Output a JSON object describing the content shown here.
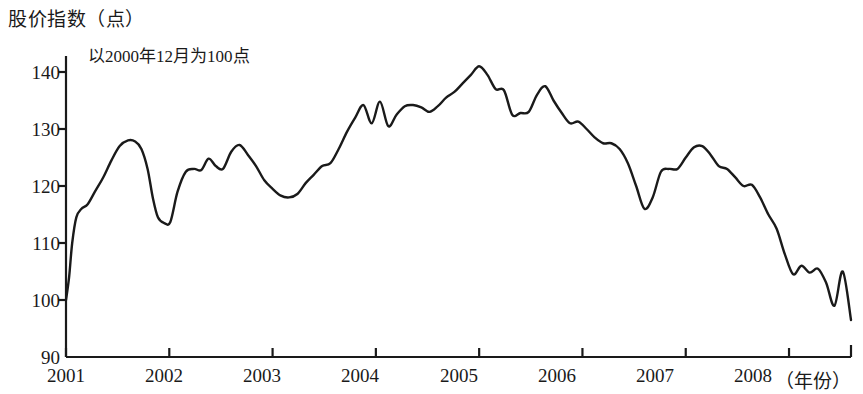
{
  "chart_data": {
    "type": "line",
    "title": "股价指数（点）",
    "annotation": "以2000年12月为100点",
    "xlabel": "（年份）",
    "ylabel": "股价指数（点）",
    "ylim": [
      90,
      140
    ],
    "xlim": [
      2001,
      2008.6
    ],
    "grid": false,
    "legend": null,
    "ytick_labels": [
      "140",
      "130",
      "120",
      "110",
      "100",
      "90"
    ],
    "ytick_values": [
      140,
      130,
      120,
      110,
      100,
      90
    ],
    "xtick_labels": [
      "2001",
      "2002",
      "2003",
      "2004",
      "2005",
      "2006",
      "2007",
      "2008"
    ],
    "xtick_values": [
      2001,
      2002,
      2003,
      2004,
      2005,
      2006,
      2007,
      2008
    ],
    "series": [
      {
        "name": "股价指数",
        "color": "#1a1a1a",
        "x": [
          2001.0,
          2001.03,
          2001.06,
          2001.1,
          2001.15,
          2001.21,
          2001.28,
          2001.36,
          2001.44,
          2001.52,
          2001.6,
          2001.67,
          2001.73,
          2001.79,
          2001.84,
          2001.89,
          2001.95,
          2002.01,
          2002.08,
          2002.16,
          2002.24,
          2002.31,
          2002.38,
          2002.45,
          2002.52,
          2002.6,
          2002.68,
          2002.76,
          2002.84,
          2002.92,
          2003.0,
          2003.08,
          2003.16,
          2003.24,
          2003.32,
          2003.4,
          2003.48,
          2003.56,
          2003.64,
          2003.72,
          2003.8,
          2003.88,
          2003.96,
          2004.04,
          2004.12,
          2004.2,
          2004.28,
          2004.36,
          2004.44,
          2004.52,
          2004.6,
          2004.68,
          2004.76,
          2004.84,
          2004.92,
          2005.0,
          2005.08,
          2005.16,
          2005.24,
          2005.32,
          2005.4,
          2005.48,
          2005.56,
          2005.64,
          2005.72,
          2005.8,
          2005.88,
          2005.96,
          2006.04,
          2006.12,
          2006.2,
          2006.28,
          2006.36,
          2006.44,
          2006.52,
          2006.6,
          2006.68,
          2006.76,
          2006.84,
          2006.92,
          2007.0,
          2007.08,
          2007.16,
          2007.24,
          2007.32,
          2007.4,
          2007.48,
          2007.56,
          2007.64,
          2007.72,
          2007.8,
          2007.88,
          2007.96,
          2008.04,
          2008.12,
          2008.2,
          2008.28,
          2008.36,
          2008.44,
          2008.52,
          2008.6
        ],
        "y": [
          100.0,
          104.0,
          110.0,
          114.5,
          116.0,
          116.8,
          119.0,
          121.5,
          124.5,
          127.0,
          128.0,
          127.8,
          126.5,
          123.0,
          118.0,
          114.5,
          113.5,
          113.7,
          119.0,
          122.5,
          123.0,
          122.8,
          124.8,
          123.5,
          123.0,
          126.0,
          127.2,
          125.5,
          123.5,
          121.0,
          119.5,
          118.3,
          118.0,
          118.6,
          120.5,
          122.0,
          123.5,
          124.0,
          126.5,
          129.5,
          132.0,
          134.2,
          131.0,
          134.8,
          130.5,
          132.5,
          134.0,
          134.2,
          133.8,
          133.0,
          134.0,
          135.5,
          136.5,
          138.0,
          139.5,
          141.0,
          139.5,
          137.0,
          136.8,
          132.5,
          132.8,
          133.0,
          136.0,
          137.5,
          135.0,
          132.8,
          131.0,
          131.3,
          130.0,
          128.5,
          127.5,
          127.5,
          126.5,
          124.0,
          120.0,
          116.0,
          118.0,
          122.5,
          123.0,
          123.0,
          125.0,
          126.8,
          127.0,
          125.5,
          123.5,
          123.0,
          121.5,
          120.0,
          120.2,
          118.0,
          115.0,
          112.5,
          108.0,
          104.5,
          106.0,
          104.8,
          105.5,
          103.0,
          99.0,
          105.0,
          96.5
        ]
      }
    ]
  },
  "axis": {
    "tick_color": "#1a1a1a",
    "line_color": "#1a1a1a"
  }
}
